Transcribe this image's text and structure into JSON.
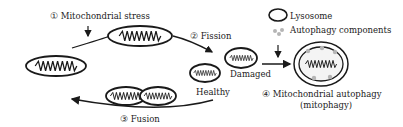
{
  "labels": {
    "stress": "① Mitochondrial stress",
    "fission": "② Fission",
    "fusion": "③ Fusion",
    "mitophagy_line1": "④ Mitochondrial autophagy",
    "mitophagy_line2": "(mitophagy)",
    "healthy": "Healthy",
    "damaged": "Damaged"
  },
  "legend": {
    "lysosome": "Lysosome",
    "autophagy_components": "Autophagy components"
  },
  "colors": {
    "stroke": "#1a1a1a",
    "components": "#b5b5b5",
    "background": "#ffffff"
  }
}
